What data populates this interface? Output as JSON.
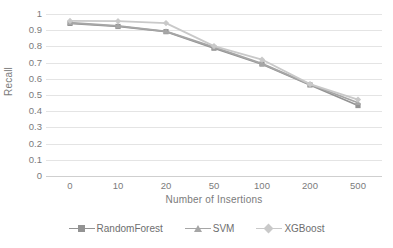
{
  "chart_data": {
    "type": "line",
    "title": "",
    "xlabel": "Number of Insertions",
    "ylabel": "Recall",
    "categories": [
      "0",
      "10",
      "20",
      "50",
      "100",
      "200",
      "500"
    ],
    "ylim": [
      0,
      1
    ],
    "yticks": [
      "1",
      "0.9",
      "0.8",
      "0.7",
      "0.6",
      "0.5",
      "0.4",
      "0.3",
      "0.2",
      "0.1",
      "0"
    ],
    "grid": true,
    "legend_position": "bottom",
    "series": [
      {
        "name": "RandomForest",
        "marker": "square",
        "color": "#939393",
        "values": [
          0.942,
          0.923,
          0.891,
          0.789,
          0.691,
          0.562,
          0.435
        ]
      },
      {
        "name": "SVM",
        "marker": "triangle",
        "color": "#a6a6a6",
        "values": [
          0.946,
          0.927,
          0.893,
          0.795,
          0.694,
          0.566,
          0.452
        ]
      },
      {
        "name": "XGBoost",
        "marker": "diamond",
        "color": "#c9c9c9",
        "values": [
          0.957,
          0.956,
          0.944,
          0.802,
          0.719,
          0.567,
          0.472
        ]
      }
    ]
  },
  "colors": {
    "gridline": "#e4e4e4",
    "axis": "#cfcfcf",
    "text": "#7b7b7b"
  }
}
